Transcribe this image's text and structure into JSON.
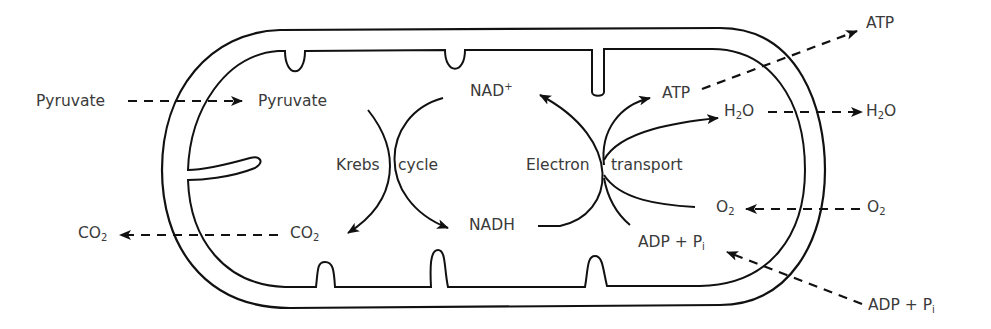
{
  "diagram": {
    "structure": {
      "outer_membrane": "mitochondrion-outer-membrane",
      "inner_membrane": "mitochondrion-inner-membrane-with-cristae"
    },
    "processes": {
      "krebs_left": "Krebs",
      "krebs_right": "cycle",
      "et_left": "Electron",
      "et_right": "transport"
    },
    "labels": {
      "pyruvate_outside": "Pyruvate",
      "pyruvate_inside": "Pyruvate",
      "co2_outside_base": "CO",
      "co2_outside_sub": "2",
      "co2_inside_base": "CO",
      "co2_inside_sub": "2",
      "nad_base": "NAD",
      "nad_sup": "+",
      "nadh": "NADH",
      "atp_inside": "ATP",
      "atp_outside": "ATP",
      "h2o_inside_a": "H",
      "h2o_inside_sub": "2",
      "h2o_inside_b": "O",
      "h2o_outside_a": "H",
      "h2o_outside_sub": "2",
      "h2o_outside_b": "O",
      "o2_inside_base": "O",
      "o2_inside_sub": "2",
      "o2_outside_base": "O",
      "o2_outside_sub": "2",
      "adp_inside_base": "ADP + P",
      "adp_inside_sub": "i",
      "adp_outside_base": "ADP + P",
      "adp_outside_sub": "i"
    },
    "colors": {
      "line": "#111111",
      "text": "#3a3a3a",
      "background": "#ffffff"
    }
  }
}
